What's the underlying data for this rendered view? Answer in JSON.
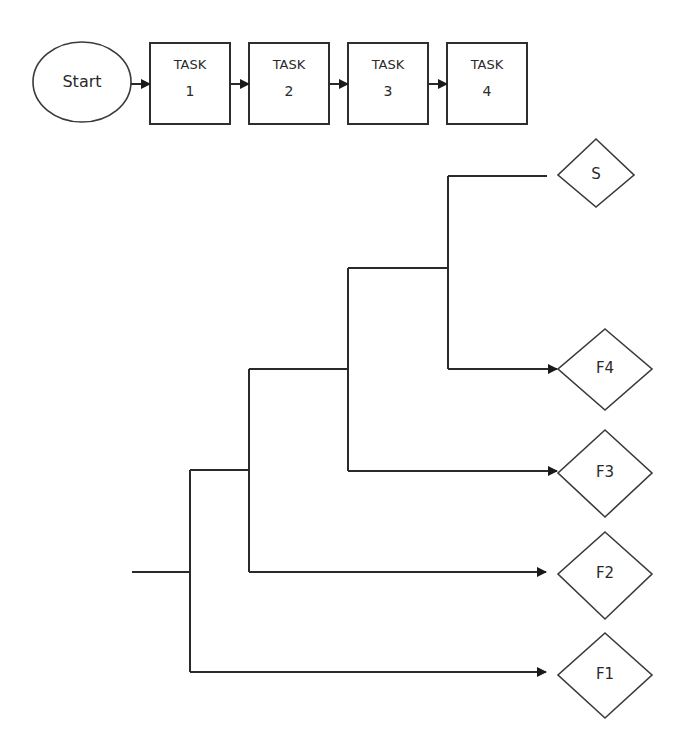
{
  "process_flow": {
    "start": {
      "label": "Start"
    },
    "tasks": [
      {
        "title": "TASK",
        "number": "1"
      },
      {
        "title": "TASK",
        "number": "2"
      },
      {
        "title": "TASK",
        "number": "3"
      },
      {
        "title": "TASK",
        "number": "4"
      }
    ]
  },
  "outcome_tree": {
    "outcomes": [
      {
        "label": "S"
      },
      {
        "label": "F4"
      },
      {
        "label": "F3"
      },
      {
        "label": "F2"
      },
      {
        "label": "F1"
      }
    ]
  },
  "colors": {
    "line": "#2a2a2a",
    "background": "#ffffff"
  }
}
